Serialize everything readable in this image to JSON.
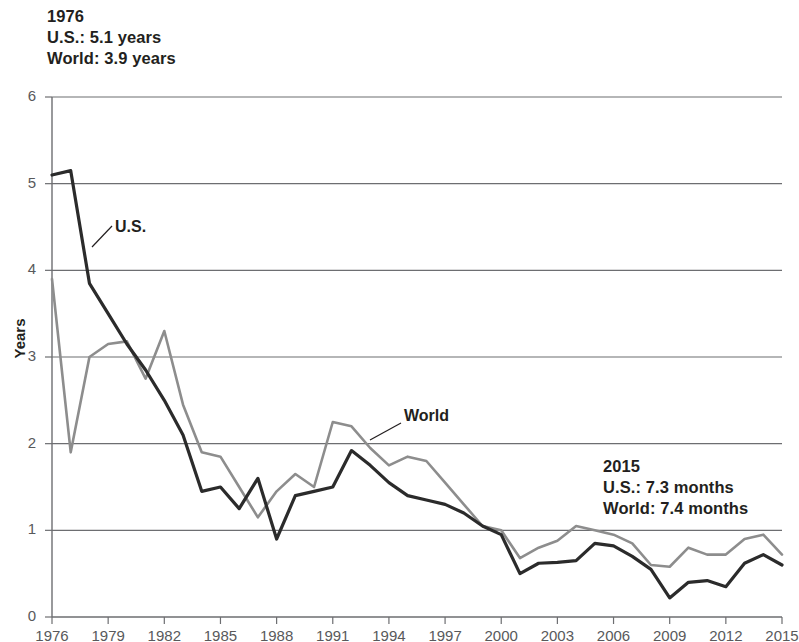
{
  "annotations": {
    "left": {
      "year": "1976",
      "us": "U.S.: 5.1 years",
      "world": "World: 3.9 years"
    },
    "right": {
      "year": "2015",
      "us": "U.S.: 7.3 months",
      "world": "World: 7.4 months"
    }
  },
  "series_labels": {
    "us": "U.S.",
    "world": "World"
  },
  "axis": {
    "ylabel": "Years",
    "yticks": [
      "0",
      "1",
      "2",
      "3",
      "4",
      "5",
      "6"
    ],
    "xticks": [
      "1976",
      "1979",
      "1982",
      "1985",
      "1988",
      "1991",
      "1994",
      "1997",
      "2000",
      "2003",
      "2006",
      "2009",
      "2012",
      "2015"
    ]
  },
  "colors": {
    "us_line": "#2b2b2b",
    "world_line": "#8d8d8d",
    "grid": "#6d6e71",
    "axis": "#6d6e71",
    "text": "#231f20",
    "tick_text": "#58595b"
  },
  "chart_data": {
    "type": "line",
    "title": "",
    "xlabel": "",
    "ylabel": "Years",
    "xlim": [
      1976,
      2015
    ],
    "ylim": [
      0,
      6
    ],
    "yticks": [
      0,
      1,
      2,
      3,
      4,
      5,
      6
    ],
    "xticks": [
      1976,
      1979,
      1982,
      1985,
      1988,
      1991,
      1994,
      1997,
      2000,
      2003,
      2006,
      2009,
      2012,
      2015
    ],
    "grid": "horizontal",
    "legend": "inline-labels",
    "x": [
      1976,
      1977,
      1978,
      1979,
      1980,
      1981,
      1982,
      1983,
      1984,
      1985,
      1986,
      1987,
      1988,
      1989,
      1990,
      1991,
      1992,
      1993,
      1994,
      1995,
      1996,
      1997,
      1998,
      1999,
      2000,
      2001,
      2002,
      2003,
      2004,
      2005,
      2006,
      2007,
      2008,
      2009,
      2010,
      2011,
      2012,
      2013,
      2014,
      2015
    ],
    "series": [
      {
        "name": "U.S.",
        "color": "#2b2b2b",
        "values": [
          5.1,
          5.15,
          3.85,
          3.5,
          3.15,
          2.85,
          2.5,
          2.1,
          1.45,
          1.5,
          1.25,
          1.6,
          0.9,
          1.4,
          1.45,
          1.5,
          1.92,
          1.75,
          1.55,
          1.4,
          1.35,
          1.3,
          1.2,
          1.05,
          0.95,
          0.5,
          0.62,
          0.63,
          0.65,
          0.85,
          0.82,
          0.7,
          0.55,
          0.22,
          0.4,
          0.42,
          0.35,
          0.62,
          0.72,
          0.6
        ]
      },
      {
        "name": "World",
        "color": "#8d8d8d",
        "values": [
          3.9,
          1.9,
          3.0,
          3.15,
          3.18,
          2.75,
          3.3,
          2.45,
          1.9,
          1.85,
          1.5,
          1.15,
          1.45,
          1.65,
          1.5,
          2.25,
          2.2,
          1.95,
          1.75,
          1.85,
          1.8,
          1.55,
          1.3,
          1.05,
          1.0,
          0.68,
          0.8,
          0.88,
          1.05,
          1.0,
          0.95,
          0.85,
          0.6,
          0.58,
          0.8,
          0.72,
          0.72,
          0.9,
          0.95,
          0.72
        ]
      }
    ],
    "endpoint_annotations": [
      {
        "year": 1976,
        "us": "5.1 years",
        "world": "3.9 years"
      },
      {
        "year": 2015,
        "us": "7.3 months",
        "world": "7.4 months"
      }
    ]
  }
}
